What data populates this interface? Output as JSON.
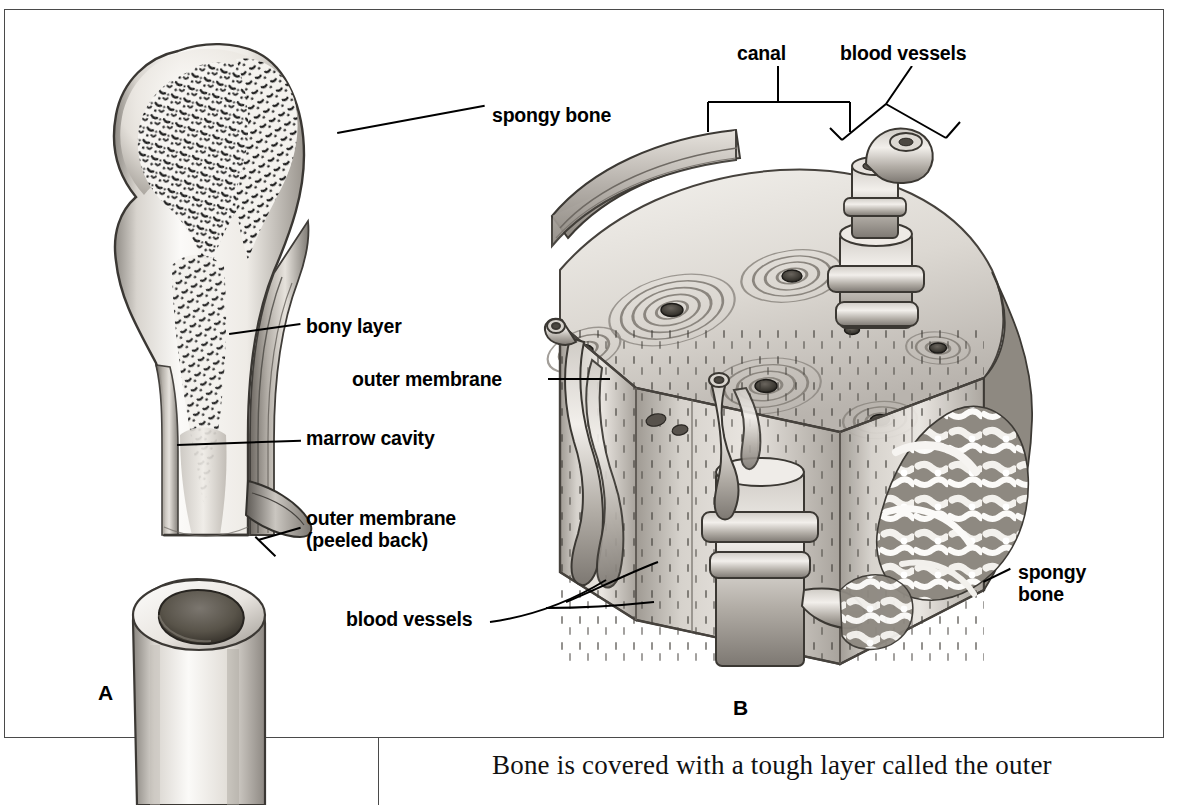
{
  "figure": {
    "panels": [
      {
        "letter": "A",
        "name": "long-bone-section"
      },
      {
        "letter": "B",
        "name": "compact-bone-block"
      }
    ]
  },
  "panel_a": {
    "letter": "A",
    "labels": [
      {
        "id": "spongy-bone",
        "text": "spongy bone"
      },
      {
        "id": "bony-layer",
        "text": "bony layer"
      },
      {
        "id": "marrow-cavity",
        "text": "marrow cavity"
      },
      {
        "id": "outer-membrane",
        "text": "outer membrane"
      },
      {
        "id": "outer-membrane-peeled",
        "text": "(peeled back)"
      }
    ]
  },
  "panel_b": {
    "letter": "B",
    "labels": [
      {
        "id": "canal",
        "text": "canal"
      },
      {
        "id": "blood-vessels-top",
        "text": "blood vessels"
      },
      {
        "id": "outer-membrane",
        "text": "outer membrane"
      },
      {
        "id": "blood-vessels-bottom",
        "text": "blood vessels"
      },
      {
        "id": "spongy-bone-1",
        "text": "spongy"
      },
      {
        "id": "spongy-bone-2",
        "text": "bone"
      }
    ]
  },
  "caption": {
    "text": "Bone is covered with a tough layer called the outer"
  },
  "colors": {
    "frame": "#4a4a4a",
    "ink": "#000000",
    "bone_light": "#f2f0ec",
    "bone_mid": "#b8b4ae",
    "bone_dark": "#6e6a64",
    "cavity": "#5a5650",
    "page": "#ffffff"
  }
}
